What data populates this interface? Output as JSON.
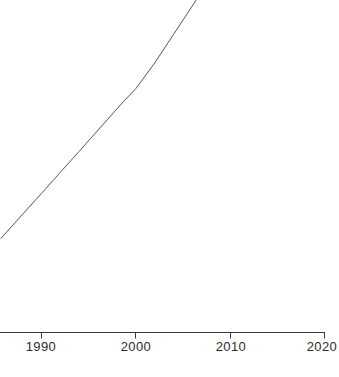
{
  "chart_data": {
    "type": "line",
    "title": "",
    "subtitle": "",
    "xlabel": "",
    "ylabel": "",
    "xlim": [
      1985.7,
      2020.0
    ],
    "ylim": [
      0,
      100
    ],
    "grid": false,
    "legend": null,
    "x_ticks": [
      1990,
      2000,
      2010,
      2020
    ],
    "x_tick_labels": [
      "1990",
      "2000",
      "2010",
      "2020"
    ],
    "y_ticks": [],
    "y_tick_labels": [],
    "series": [
      {
        "name": "series-1",
        "color": "#555555",
        "line_width": 1,
        "x": [
          1985.7,
          1988.0,
          1990.0,
          1992.0,
          1994.0,
          1996.0,
          1998.7,
          2000.0,
          2002.0,
          2004.0,
          2006.4
        ],
        "values": [
          23.0,
          28.9,
          34.0,
          39.2,
          44.3,
          49.5,
          56.5,
          59.6,
          65.9,
          72.9,
          81.3
        ]
      }
    ],
    "annotations": []
  },
  "axis": {
    "x_axis_name": "x-axis",
    "tick_color": "#3a3a3a",
    "spine_color": "#3a3a3a",
    "label_color": "#2b2b2b"
  },
  "canvas": {
    "background": "#ffffff",
    "width": 339,
    "height": 377
  }
}
